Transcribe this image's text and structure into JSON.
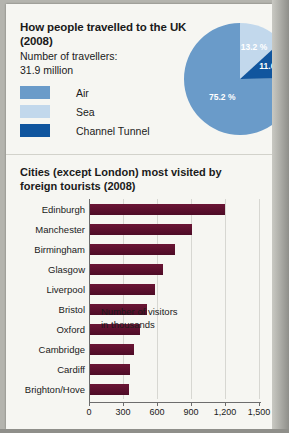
{
  "pie_panel": {
    "title": "How people travelled to the UK (2008)",
    "subtitle_line1": "Number of travellers:",
    "subtitle_line2": "31.9 million",
    "legend": [
      {
        "label": "Air",
        "color": "#6a9bc9"
      },
      {
        "label": "Sea",
        "color": "#c2d8ec"
      },
      {
        "label": "Channel Tunnel",
        "color": "#10559e"
      }
    ]
  },
  "bar_panel": {
    "title": "Cities (except London) most visited by foreign tourists (2008)",
    "note_line1": "Number of visitors",
    "note_line2": "in thousands"
  },
  "chart_data": [
    {
      "type": "pie",
      "title": "How people travelled to the UK (2008)",
      "subtitle": "Number of travellers: 31.9 million",
      "legend_position": "left",
      "slices": [
        {
          "name": "Sea",
          "value": 13.2,
          "label": "13.2 %",
          "color": "#c2d8ec"
        },
        {
          "name": "Channel Tunnel",
          "value": 11.6,
          "label": "11.6 %",
          "color": "#10559e"
        },
        {
          "name": "Air",
          "value": 75.2,
          "label": "75.2 %",
          "color": "#6a9bc9"
        }
      ]
    },
    {
      "type": "bar",
      "orientation": "horizontal",
      "title": "Cities (except London) most visited by foreign tourists (2008)",
      "xlabel": "Number of visitors in thousands",
      "ylabel": "",
      "xlim": [
        0,
        1500
      ],
      "xticks": [
        0,
        300,
        600,
        900,
        1200,
        1500
      ],
      "xtick_labels": [
        "0",
        "300",
        "600",
        "900",
        "1,200",
        "1,500"
      ],
      "grid": true,
      "bar_color": "#5d1030",
      "categories": [
        "Edinburgh",
        "Manchester",
        "Birmingham",
        "Glasgow",
        "Liverpool",
        "Bristol",
        "Oxford",
        "Cambridge",
        "Cardiff",
        "Brighton/Hove"
      ],
      "values": [
        1195,
        900,
        750,
        640,
        570,
        500,
        445,
        390,
        350,
        345
      ]
    }
  ]
}
